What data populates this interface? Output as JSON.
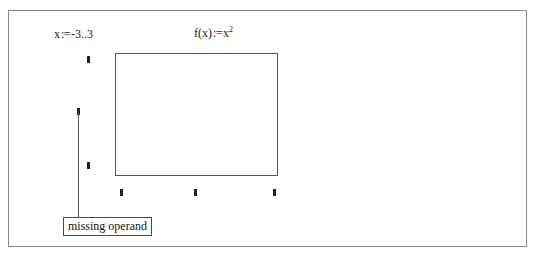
{
  "worksheet": {
    "expressions": [
      {
        "name": "range-variable-definition",
        "lhs": "x",
        "operator": ":=",
        "rhs_start": "-3",
        "rhs_dots": "..",
        "rhs_end": "3",
        "full_text": "x := -3 .. 3"
      },
      {
        "name": "function-definition",
        "lhs": "f(x)",
        "operator": ":=",
        "base": "x",
        "exponent": "2",
        "full_text": "f(x) := x2"
      }
    ],
    "plot": {
      "type": "xy-plot",
      "state": "empty",
      "y_axis_placeholders": [
        "",
        "",
        ""
      ],
      "x_axis_placeholders": [
        "",
        "",
        ""
      ],
      "selected_placeholder": "y-axis-middle"
    },
    "error_tooltip": {
      "message": "missing operand"
    },
    "colors": {
      "page_border": "#8c8c8c",
      "plot_border": "#555555",
      "placeholder": "#202020",
      "leader_line": "#5a5a5a",
      "tooltip_border": "#4a4a4a",
      "text": "#141414",
      "background": "#ffffff"
    }
  }
}
